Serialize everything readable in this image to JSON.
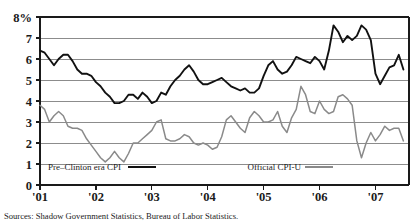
{
  "figure": {
    "source_note": "Sources: Shadow Government Statistics, Bureau of Labor Statistics.",
    "y_axis_top_label": "8%"
  },
  "chart_data": {
    "type": "line",
    "title": "",
    "xlabel": "",
    "ylabel": "",
    "ylim": [
      0,
      8
    ],
    "xlim": [
      2001.0,
      2007.6
    ],
    "grid": true,
    "gridlines_y": [
      1,
      2,
      3,
      4,
      5,
      6,
      7
    ],
    "ytick_labels": [
      "0",
      "1",
      "2",
      "3",
      "4",
      "5",
      "6",
      "7",
      "8%"
    ],
    "ytick_values": [
      0,
      1,
      2,
      3,
      4,
      5,
      6,
      7,
      8
    ],
    "xtick_labels": [
      "'01",
      "'02",
      "'03",
      "'04",
      "'05",
      "'06",
      "'07"
    ],
    "xtick_values": [
      2001,
      2002,
      2003,
      2004,
      2005,
      2006,
      2007
    ],
    "legend_position": "inside-bottom",
    "series": [
      {
        "name": "Pre–Clinton era CPI",
        "color": "#111111",
        "width": 1.9,
        "x": [
          2001.0,
          2001.083,
          2001.167,
          2001.25,
          2001.333,
          2001.417,
          2001.5,
          2001.583,
          2001.667,
          2001.75,
          2001.833,
          2001.917,
          2002.0,
          2002.083,
          2002.167,
          2002.25,
          2002.333,
          2002.417,
          2002.5,
          2002.583,
          2002.667,
          2002.75,
          2002.833,
          2002.917,
          2003.0,
          2003.083,
          2003.167,
          2003.25,
          2003.333,
          2003.417,
          2003.5,
          2003.583,
          2003.667,
          2003.75,
          2003.833,
          2003.917,
          2004.0,
          2004.083,
          2004.167,
          2004.25,
          2004.333,
          2004.417,
          2004.5,
          2004.583,
          2004.667,
          2004.75,
          2004.833,
          2004.917,
          2005.0,
          2005.083,
          2005.167,
          2005.25,
          2005.333,
          2005.417,
          2005.5,
          2005.583,
          2005.667,
          2005.75,
          2005.833,
          2005.917,
          2006.0,
          2006.083,
          2006.167,
          2006.25,
          2006.333,
          2006.417,
          2006.5,
          2006.583,
          2006.667,
          2006.75,
          2006.833,
          2006.917,
          2007.0,
          2007.083,
          2007.167,
          2007.25,
          2007.333,
          2007.417,
          2007.5
        ],
        "values": [
          6.4,
          6.3,
          6.0,
          5.7,
          6.0,
          6.2,
          6.2,
          5.9,
          5.5,
          5.3,
          5.3,
          5.2,
          4.9,
          4.7,
          4.4,
          4.2,
          3.9,
          3.9,
          4.0,
          4.3,
          4.3,
          4.1,
          4.4,
          4.2,
          3.9,
          4.0,
          4.4,
          4.3,
          4.7,
          5.0,
          5.2,
          5.5,
          5.7,
          5.4,
          5.0,
          4.8,
          4.8,
          4.9,
          5.0,
          5.1,
          4.9,
          4.7,
          4.6,
          4.5,
          4.6,
          4.4,
          4.4,
          4.6,
          5.2,
          5.7,
          5.9,
          5.5,
          5.3,
          5.4,
          5.7,
          6.1,
          6.0,
          5.9,
          5.8,
          6.1,
          5.9,
          5.5,
          6.4,
          7.6,
          7.3,
          6.8,
          7.1,
          6.9,
          7.1,
          7.6,
          7.4,
          6.9,
          5.3,
          4.8,
          5.2,
          5.6,
          5.7,
          6.2,
          5.5
        ]
      },
      {
        "name": "Official CPI-U",
        "color": "#8a8a8a",
        "width": 1.5,
        "x": [
          2001.0,
          2001.083,
          2001.167,
          2001.25,
          2001.333,
          2001.417,
          2001.5,
          2001.583,
          2001.667,
          2001.75,
          2001.833,
          2001.917,
          2002.0,
          2002.083,
          2002.167,
          2002.25,
          2002.333,
          2002.417,
          2002.5,
          2002.583,
          2002.667,
          2002.75,
          2002.833,
          2002.917,
          2003.0,
          2003.083,
          2003.167,
          2003.25,
          2003.333,
          2003.417,
          2003.5,
          2003.583,
          2003.667,
          2003.75,
          2003.833,
          2003.917,
          2004.0,
          2004.083,
          2004.167,
          2004.25,
          2004.333,
          2004.417,
          2004.5,
          2004.583,
          2004.667,
          2004.75,
          2004.833,
          2004.917,
          2005.0,
          2005.083,
          2005.167,
          2005.25,
          2005.333,
          2005.417,
          2005.5,
          2005.583,
          2005.667,
          2005.75,
          2005.833,
          2005.917,
          2006.0,
          2006.083,
          2006.167,
          2006.25,
          2006.333,
          2006.417,
          2006.5,
          2006.583,
          2006.667,
          2006.75,
          2006.833,
          2006.917,
          2007.0,
          2007.083,
          2007.167,
          2007.25,
          2007.333,
          2007.417,
          2007.5
        ],
        "values": [
          3.8,
          3.6,
          3.0,
          3.3,
          3.5,
          3.3,
          2.8,
          2.7,
          2.7,
          2.6,
          2.2,
          1.9,
          1.6,
          1.3,
          1.1,
          1.3,
          1.6,
          1.3,
          1.1,
          1.5,
          2.0,
          2.0,
          2.2,
          2.4,
          2.6,
          3.0,
          3.1,
          2.2,
          2.1,
          2.1,
          2.2,
          2.4,
          2.3,
          2.0,
          1.9,
          2.0,
          1.9,
          1.7,
          1.8,
          2.3,
          3.1,
          3.3,
          3.0,
          2.7,
          2.5,
          3.2,
          3.5,
          3.3,
          3.0,
          3.0,
          3.1,
          3.5,
          2.8,
          2.5,
          3.2,
          3.6,
          4.7,
          4.3,
          3.5,
          3.4,
          4.0,
          3.6,
          3.4,
          3.5,
          4.2,
          4.3,
          4.1,
          3.8,
          2.1,
          1.3,
          2.0,
          2.5,
          2.1,
          2.4,
          2.8,
          2.6,
          2.7,
          2.7,
          2.1
        ]
      }
    ],
    "legend": [
      {
        "label": "Pre–Clinton era CPI",
        "color": "#111111",
        "width": 2.4
      },
      {
        "label": "Official CPI-U",
        "color": "#8a8a8a",
        "width": 1.6
      }
    ]
  }
}
